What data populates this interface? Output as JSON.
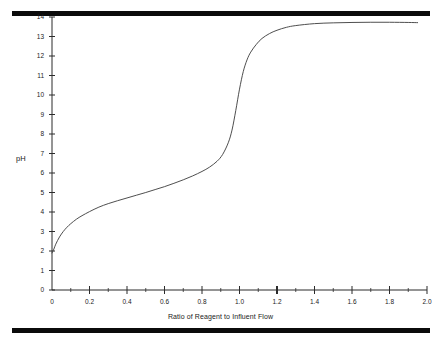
{
  "figure": {
    "top_rule": "black-rule",
    "bottom_rule": "black-rule",
    "line_color": "#3a3a3a",
    "axis_color": "#2b2b2b",
    "rule_color": "#0b0b0b"
  },
  "chart_data": {
    "type": "line",
    "title": "",
    "xlabel": "Ratio of Reagent to Influent Flow",
    "ylabel": "pH",
    "xlim": [
      0,
      2.0
    ],
    "ylim": [
      0,
      14
    ],
    "grid": false,
    "legend": null,
    "xticks": [
      0,
      0.2,
      0.4,
      0.6,
      0.8,
      1.0,
      1.2,
      1.4,
      1.6,
      1.8,
      2.0
    ],
    "xtick_labels": [
      "0",
      "0.2",
      "0.4",
      "0.6",
      "0.8",
      "1.0",
      "1.2",
      "1.4",
      "1.6",
      "1.8",
      "2.0"
    ],
    "yticks": [
      0,
      1,
      2,
      3,
      4,
      5,
      6,
      7,
      8,
      9,
      10,
      11,
      12,
      13,
      14
    ],
    "ytick_labels": [
      "0",
      "1",
      "2",
      "3",
      "4",
      "5",
      "6",
      "7",
      "8",
      "9",
      "10",
      "11",
      "12",
      "13",
      "14"
    ],
    "minor_xticks": [
      0.1,
      0.3,
      0.5,
      0.7,
      0.9,
      1.1,
      1.3,
      1.5,
      1.7,
      1.9
    ],
    "series": [
      {
        "name": "Titration curve",
        "x": [
          0.0,
          0.01,
          0.02,
          0.04,
          0.06,
          0.08,
          0.1,
          0.13,
          0.16,
          0.2,
          0.25,
          0.3,
          0.35,
          0.4,
          0.45,
          0.5,
          0.55,
          0.6,
          0.65,
          0.7,
          0.75,
          0.8,
          0.84,
          0.88,
          0.91,
          0.94,
          0.96,
          0.98,
          1.0,
          1.02,
          1.04,
          1.06,
          1.09,
          1.12,
          1.16,
          1.2,
          1.25,
          1.3,
          1.4,
          1.5,
          1.6,
          1.7,
          1.8,
          1.9,
          1.95
        ],
        "y": [
          1.9,
          2.1,
          2.35,
          2.72,
          3.0,
          3.22,
          3.4,
          3.63,
          3.81,
          4.02,
          4.25,
          4.43,
          4.58,
          4.72,
          4.86,
          5.0,
          5.15,
          5.3,
          5.47,
          5.65,
          5.85,
          6.08,
          6.3,
          6.6,
          6.95,
          7.55,
          8.2,
          9.2,
          10.3,
          11.2,
          11.8,
          12.2,
          12.6,
          12.9,
          13.15,
          13.32,
          13.47,
          13.56,
          13.66,
          13.7,
          13.72,
          13.73,
          13.73,
          13.72,
          13.71
        ]
      }
    ]
  },
  "geometry": {
    "plot_left_px": 52,
    "plot_right_px": 427,
    "plot_top_px": 17,
    "plot_bottom_px": 290
  }
}
